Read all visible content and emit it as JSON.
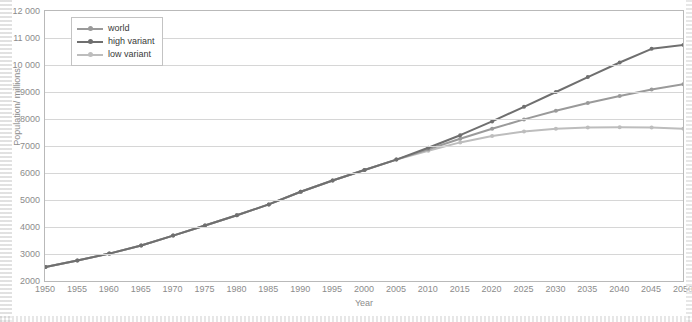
{
  "chart_data": {
    "type": "line",
    "title": "",
    "xlabel": "Year",
    "ylabel": "Population/ millions",
    "xlim": [
      1950,
      2050
    ],
    "ylim": [
      2000,
      12000
    ],
    "grid": true,
    "legend_position": "top-left",
    "x_ticks": [
      "1950",
      "1955",
      "1960",
      "1965",
      "1970",
      "1975",
      "1980",
      "1985",
      "1990",
      "1995",
      "2000",
      "2005",
      "2010",
      "2015",
      "2020",
      "2025",
      "2030",
      "2035",
      "2040",
      "2045",
      "2050"
    ],
    "y_ticks": [
      "2000",
      "3000",
      "4000",
      "5000",
      "6000",
      "7000",
      "8000",
      "9000",
      "10 000",
      "11 000",
      "12 000"
    ],
    "x": [
      1950,
      1955,
      1960,
      1965,
      1970,
      1975,
      1980,
      1985,
      1990,
      1995,
      2000,
      2005,
      2010,
      2015,
      2020,
      2025,
      2030,
      2035,
      2040,
      2045,
      2050
    ],
    "series": [
      {
        "name": "world",
        "color": "#9a9a9a",
        "values": [
          2536,
          2773,
          3035,
          3335,
          3699,
          4074,
          4452,
          4856,
          5321,
          5741,
          6128,
          6515,
          6896,
          7284,
          7656,
          8002,
          8321,
          8612,
          8874,
          9106,
          9306
        ]
      },
      {
        "name": "high variant",
        "color": "#6f6f6f",
        "values": [
          2536,
          2773,
          3035,
          3335,
          3699,
          4074,
          4452,
          4856,
          5321,
          5741,
          6128,
          6515,
          6950,
          7420,
          7930,
          8470,
          9020,
          9570,
          10110,
          10620,
          10760
        ]
      },
      {
        "name": "low variant",
        "color": "#bdbdbd",
        "values": [
          2536,
          2773,
          3035,
          3335,
          3699,
          4074,
          4452,
          4856,
          5321,
          5741,
          6128,
          6515,
          6840,
          7150,
          7390,
          7560,
          7660,
          7700,
          7710,
          7700,
          7660
        ]
      }
    ]
  },
  "legend": {
    "items": [
      {
        "label": "world"
      },
      {
        "label": "high variant"
      },
      {
        "label": "low variant"
      }
    ]
  }
}
